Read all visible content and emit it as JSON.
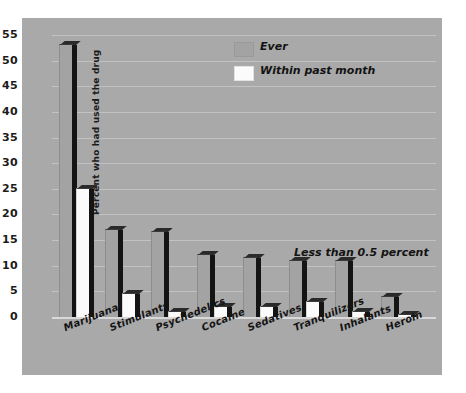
{
  "chart_data": {
    "type": "bar",
    "title": "",
    "xlabel": "",
    "ylabel": "Percent who had used the drug",
    "ylim": [
      0,
      55
    ],
    "ytick_step": 5,
    "yticks": [
      0,
      5,
      10,
      15,
      20,
      25,
      30,
      35,
      40,
      45,
      50,
      55
    ],
    "grid": true,
    "legend_position": "top-center-right",
    "categories": [
      "Marijuana",
      "Stimulants",
      "Psychedelics",
      "Cocaine",
      "Sedatives",
      "Tranquilizers",
      "Inhalants",
      "Heroin"
    ],
    "series": [
      {
        "name": "Ever",
        "color": "#a3a3a3",
        "values": [
          53,
          17,
          16.5,
          12,
          11.5,
          11,
          11,
          4
        ]
      },
      {
        "name": "Within past month",
        "color": "#fbfbfb",
        "values": [
          25,
          4.5,
          1,
          2,
          2,
          3,
          1,
          0.3
        ]
      }
    ],
    "annotations": [
      {
        "text": "Less than 0.5 percent",
        "refers_to": "Heroin within past month"
      }
    ]
  },
  "legend": {
    "items": [
      {
        "label": "Ever"
      },
      {
        "label": "Within past month"
      }
    ]
  },
  "annotation": {
    "text": "Less than 0.5 percent"
  },
  "axes": {
    "y_title": "Percent who had used the drug"
  }
}
